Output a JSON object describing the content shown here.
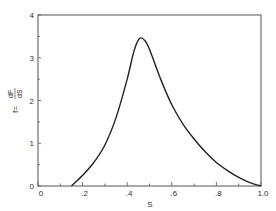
{
  "chart_data": {
    "type": "line",
    "title": "",
    "xlabel": "S",
    "ylabel": "f = dF/dS",
    "ylabel_lhs": "f=",
    "ylabel_num": "dF",
    "ylabel_den": "dS",
    "xlim": [
      0,
      1.0
    ],
    "ylim": [
      0,
      4
    ],
    "x_ticks": [
      "0",
      ".2",
      ".4",
      ".6",
      ".8",
      "1.0"
    ],
    "y_ticks": [
      "0",
      "1",
      "2",
      "3",
      "4"
    ],
    "grid": false,
    "series": [
      {
        "name": "f",
        "x": [
          0.15,
          0.2,
          0.25,
          0.3,
          0.35,
          0.4,
          0.43,
          0.455,
          0.48,
          0.5,
          0.55,
          0.6,
          0.65,
          0.7,
          0.75,
          0.8,
          0.85,
          0.9,
          0.95,
          1.0
        ],
        "y": [
          0.0,
          0.25,
          0.55,
          0.96,
          1.6,
          2.5,
          3.15,
          3.45,
          3.4,
          3.2,
          2.5,
          1.9,
          1.45,
          1.1,
          0.8,
          0.55,
          0.36,
          0.2,
          0.08,
          0.0
        ]
      }
    ]
  }
}
